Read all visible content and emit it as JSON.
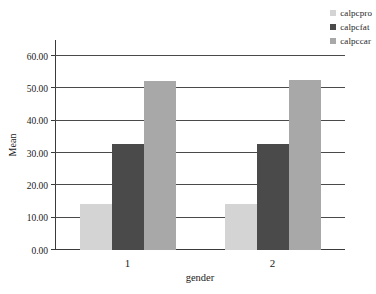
{
  "chart_data": {
    "type": "bar",
    "title": "",
    "subtitle": "",
    "xlabel": "gender",
    "ylabel": "Mean",
    "categories": [
      "1",
      "2"
    ],
    "series": [
      {
        "name": "calpcpro",
        "values": [
          14.1,
          14.1
        ],
        "color": "#d4d4d4"
      },
      {
        "name": "calpcfat",
        "values": [
          32.7,
          32.9
        ],
        "color": "#4a4a4a"
      },
      {
        "name": "calpccar",
        "values": [
          52.4,
          52.6
        ],
        "color": "#a8a8a8"
      }
    ],
    "ylim": [
      0.0,
      65.0
    ],
    "yticks": [
      0.0,
      10.0,
      20.0,
      30.0,
      40.0,
      50.0,
      60.0
    ],
    "ytick_labels": [
      "0.00",
      "10.00",
      "20.00",
      "30.00",
      "40.00",
      "50.00",
      "60.00"
    ],
    "grid": true,
    "grid_axis": "y",
    "legend_position": "top-right",
    "bar_mode": "grouped"
  },
  "legend": {
    "items": [
      {
        "label": "calpcpro",
        "color": "#d4d4d4"
      },
      {
        "label": "calpcfat",
        "color": "#4a4a4a"
      },
      {
        "label": "calpccar",
        "color": "#a8a8a8"
      }
    ]
  },
  "axes": {
    "y_title": "Mean",
    "x_title": "gender"
  }
}
